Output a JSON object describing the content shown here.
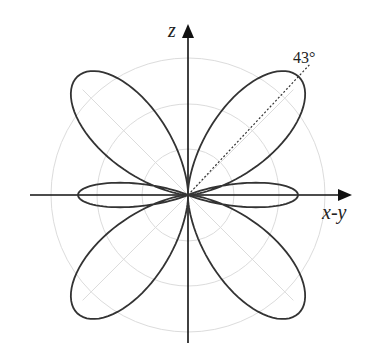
{
  "figure": {
    "type": "polar radiation pattern",
    "center": [
      188,
      195
    ],
    "axes": {
      "vertical_label": "z",
      "horizontal_label": "x-y"
    },
    "annotation": {
      "angle_label": "43°",
      "angle_from_vertical_deg": 43,
      "style": "dotted"
    },
    "grid": {
      "circle_radii": [
        46,
        91,
        137
      ],
      "radial_lines_deg": [
        45,
        135,
        225,
        315
      ],
      "color": "#dcdcdc"
    },
    "pattern": {
      "stroke_color": "#333333",
      "lobes": [
        {
          "angle_from_vertical_deg": 43,
          "length": 162,
          "half_width_deg": 15
        },
        {
          "angle_from_vertical_deg": -43,
          "length": 162,
          "half_width_deg": 15
        },
        {
          "angle_from_vertical_deg": 137,
          "length": 162,
          "half_width_deg": 15
        },
        {
          "angle_from_vertical_deg": -137,
          "length": 162,
          "half_width_deg": 15
        },
        {
          "angle_from_vertical_deg": 90,
          "length": 110,
          "half_width_deg": 8
        },
        {
          "angle_from_vertical_deg": -90,
          "length": 110,
          "half_width_deg": 8
        }
      ]
    }
  }
}
